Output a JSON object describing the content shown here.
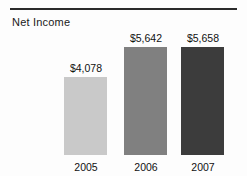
{
  "chart_data": {
    "type": "bar",
    "title": "Net Income",
    "xlabel": "",
    "ylabel": "",
    "categories": [
      "2005",
      "2006",
      "2007"
    ],
    "values": [
      4078,
      5642,
      5658
    ],
    "value_labels": [
      "$4,078",
      "$5,642",
      "$5,658"
    ],
    "series": [
      {
        "name": "Net Income",
        "values": [
          4078,
          5642,
          5658
        ]
      }
    ],
    "colors": [
      "#c9c9c9",
      "#808080",
      "#3c3c3c"
    ],
    "ylim": [
      0,
      6200
    ],
    "grid": false,
    "legend": "none",
    "axis_line": false,
    "currency": "$",
    "bars": [
      {
        "category": "2005",
        "value": 4078,
        "value_label": "$4,078",
        "color": "#c9c9c9",
        "bar_height_px": 78,
        "label_top_px": 62
      },
      {
        "category": "2006",
        "value": 5642,
        "value_label": "$5,642",
        "color": "#808080",
        "bar_height_px": 108,
        "label_top_px": 32
      },
      {
        "category": "2007",
        "value": 5658,
        "value_label": "$5,658",
        "color": "#3c3c3c",
        "bar_height_px": 108,
        "label_top_px": 32
      }
    ]
  },
  "figure": {
    "rule_color": "#2b2b2b",
    "background": "#fdfdfd"
  }
}
